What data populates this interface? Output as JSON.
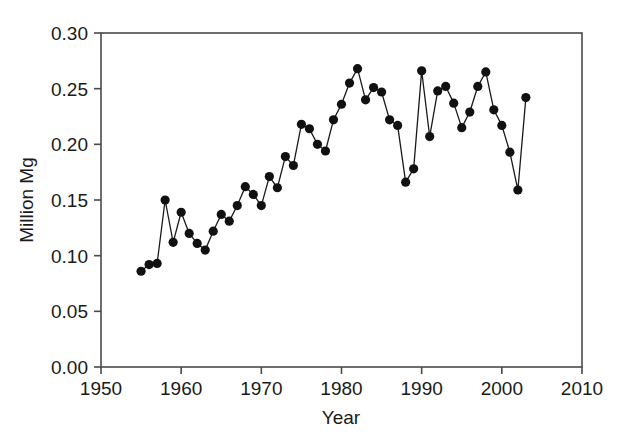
{
  "chart_data": {
    "type": "line",
    "title": "",
    "subtitle": "",
    "xlabel": "Year",
    "ylabel": "Million Mg",
    "xlim": [
      1950,
      2010
    ],
    "ylim": [
      0.0,
      0.3
    ],
    "xticks": [
      1950,
      1960,
      1970,
      1980,
      1990,
      2000,
      2010
    ],
    "xtick_labels": [
      "1950",
      "1960",
      "1970",
      "1980",
      "1990",
      "2000",
      "2010"
    ],
    "yticks": [
      0.0,
      0.05,
      0.1,
      0.15,
      0.2,
      0.25,
      0.3
    ],
    "ytick_labels": [
      "0.00",
      "0.05",
      "0.10",
      "0.15",
      "0.20",
      "0.25",
      "0.30"
    ],
    "grid": false,
    "legend": null,
    "legend_position": "none",
    "marker": "filled-circle",
    "marker_color": "#111111",
    "line_color": "#1a1a1a",
    "frame_color": "#4a4a4a",
    "background_color": "#ffffff",
    "x": [
      1955,
      1956,
      1957,
      1958,
      1959,
      1960,
      1961,
      1962,
      1963,
      1964,
      1965,
      1966,
      1967,
      1968,
      1969,
      1970,
      1971,
      1972,
      1973,
      1974,
      1975,
      1976,
      1977,
      1978,
      1979,
      1980,
      1981,
      1982,
      1983,
      1984,
      1985,
      1986,
      1987,
      1988,
      1989,
      1990,
      1991,
      1992,
      1993,
      1994,
      1995,
      1996,
      1997,
      1998,
      1999,
      2000,
      2001,
      2002,
      2003
    ],
    "values": [
      0.086,
      0.092,
      0.093,
      0.15,
      0.112,
      0.139,
      0.12,
      0.111,
      0.105,
      0.122,
      0.137,
      0.131,
      0.145,
      0.162,
      0.155,
      0.145,
      0.171,
      0.161,
      0.189,
      0.181,
      0.218,
      0.214,
      0.2,
      0.194,
      0.222,
      0.236,
      0.255,
      0.268,
      0.24,
      0.251,
      0.247,
      0.222,
      0.217,
      0.166,
      0.178,
      0.266,
      0.207,
      0.248,
      0.252,
      0.237,
      0.215,
      0.229,
      0.252,
      0.265,
      0.231,
      0.217,
      0.193,
      0.159,
      0.242
    ],
    "series": [
      {
        "name": "Million Mg",
        "values": [
          0.086,
          0.092,
          0.093,
          0.15,
          0.112,
          0.139,
          0.12,
          0.111,
          0.105,
          0.122,
          0.137,
          0.131,
          0.145,
          0.162,
          0.155,
          0.145,
          0.171,
          0.161,
          0.189,
          0.181,
          0.218,
          0.214,
          0.2,
          0.194,
          0.222,
          0.236,
          0.255,
          0.268,
          0.24,
          0.251,
          0.247,
          0.222,
          0.217,
          0.166,
          0.178,
          0.266,
          0.207,
          0.248,
          0.252,
          0.237,
          0.215,
          0.229,
          0.252,
          0.265,
          0.231,
          0.217,
          0.193,
          0.159,
          0.242
        ]
      }
    ]
  }
}
